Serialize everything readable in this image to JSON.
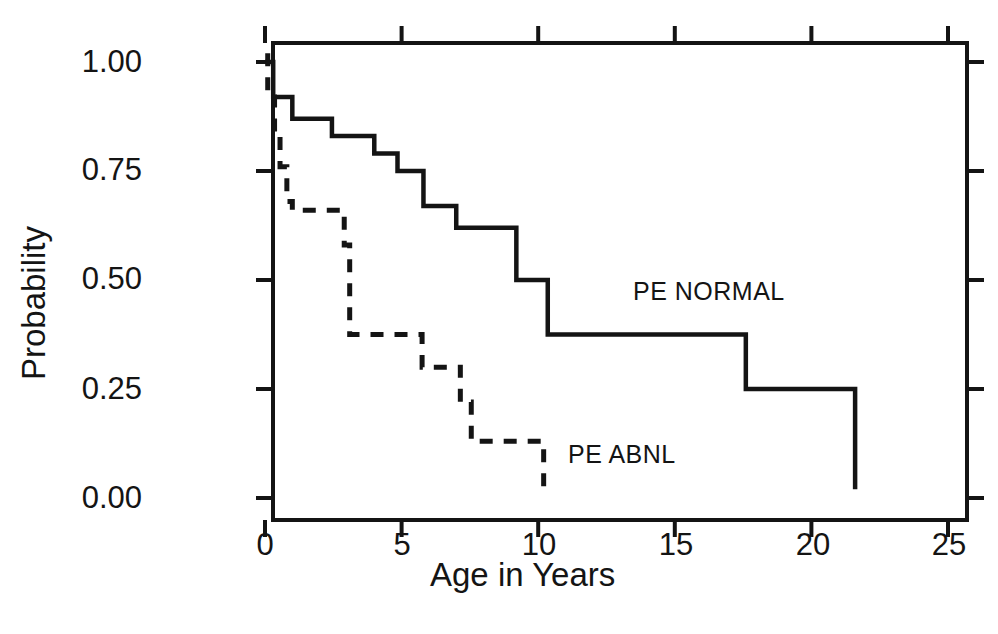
{
  "chart_data": {
    "type": "line",
    "subtype": "kaplan-meier-step",
    "title": "",
    "xlabel": "Age in Years",
    "ylabel": "Probability",
    "xlim": [
      -0.3,
      25.7
    ],
    "ylim": [
      0.0,
      1.0
    ],
    "xticks": [
      0,
      5,
      10,
      15,
      20,
      25
    ],
    "xtick_labels": [
      "0",
      "5",
      "10",
      "15",
      "20",
      "25"
    ],
    "yticks": [
      0.0,
      0.25,
      0.5,
      0.75,
      1.0
    ],
    "ytick_labels": [
      "0.00",
      "0.25",
      "0.50",
      "0.75",
      "1.00"
    ],
    "grid": false,
    "legend_position": "inline-annotation",
    "series": [
      {
        "name": "PE NORMAL",
        "linestyle": "solid",
        "color": "#141414",
        "annotation_label": "PE NORMAL",
        "x": [
          0.0,
          0.3,
          0.3,
          1.0,
          1.0,
          2.45,
          2.45,
          4.0,
          4.0,
          4.85,
          4.85,
          5.8,
          5.8,
          7.0,
          7.0,
          9.2,
          9.2,
          10.35,
          10.35,
          17.6,
          17.6,
          21.6,
          21.6
        ],
        "y": [
          1.0,
          1.0,
          0.92,
          0.92,
          0.87,
          0.87,
          0.83,
          0.83,
          0.79,
          0.79,
          0.75,
          0.75,
          0.67,
          0.67,
          0.62,
          0.62,
          0.5,
          0.5,
          0.375,
          0.375,
          0.25,
          0.25,
          0.02
        ]
      },
      {
        "name": "PE ABNL",
        "linestyle": "dashed",
        "color": "#141414",
        "annotation_label": "PE ABNL",
        "x": [
          0.1,
          0.1,
          0.35,
          0.35,
          0.55,
          0.55,
          0.8,
          0.8,
          1.0,
          1.0,
          2.9,
          2.9,
          3.1,
          3.1,
          5.75,
          5.75,
          7.15,
          7.15,
          7.55,
          7.55,
          10.2,
          10.2
        ],
        "y": [
          1.02,
          0.93,
          0.93,
          0.84,
          0.84,
          0.76,
          0.76,
          0.68,
          0.68,
          0.66,
          0.66,
          0.58,
          0.58,
          0.375,
          0.375,
          0.3,
          0.3,
          0.22,
          0.22,
          0.13,
          0.13,
          0.01
        ]
      }
    ]
  },
  "axes": {
    "ylabel_text": "Probability",
    "xlabel_text": "Age in Years",
    "ytick_0": "1.00",
    "ytick_1": "0.75",
    "ytick_2": "0.50",
    "ytick_3": "0.25",
    "ytick_4": "0.00",
    "xtick_0": "0",
    "xtick_1": "5",
    "xtick_2": "10",
    "xtick_3": "15",
    "xtick_4": "20",
    "xtick_5": "25"
  },
  "annotations": {
    "normal_label": "PE NORMAL",
    "abnormal_label": "PE ABNL"
  },
  "style": {
    "ink_color": "#141414",
    "background": "#ffffff"
  }
}
